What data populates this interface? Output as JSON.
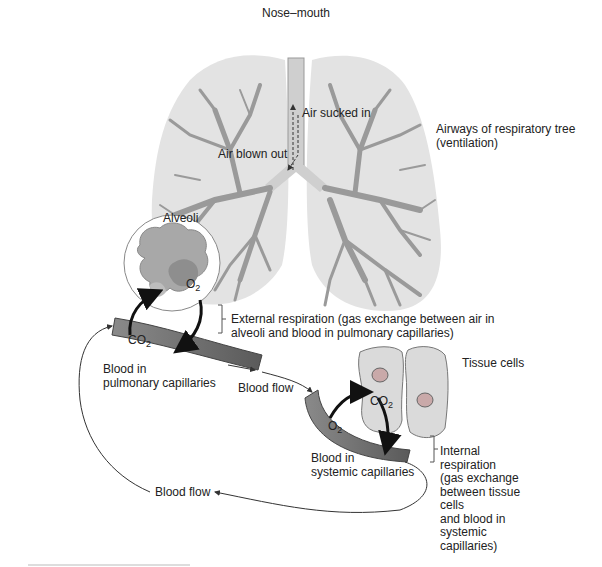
{
  "labels": {
    "nose_mouth": "Nose–mouth",
    "air_sucked_in": "Air sucked in",
    "air_blown_out": "Air blown out",
    "airways_line1": "Airways of respiratory tree",
    "airways_line2": "(ventilation)",
    "alveoli": "Alveoli",
    "o2_alveoli": "O",
    "o2_alveoli_sub": "2",
    "co2_pulmonary": "CO",
    "co2_pulmonary_sub": "2",
    "external_line1": "External respiration (gas exchange between air in",
    "external_line2": "alveoli and blood in pulmonary capillaries)",
    "blood_pulmonary_line1": "Blood in",
    "blood_pulmonary_line2": "pulmonary capillaries",
    "blood_flow_top": "Blood flow",
    "tissue_cells": "Tissue cells",
    "co2_tissue": "CO",
    "co2_tissue_sub": "2",
    "o2_systemic": "O",
    "o2_systemic_sub": "2",
    "blood_systemic_line1": "Blood in",
    "blood_systemic_line2": "systemic capillaries",
    "internal_lines": [
      "Internal",
      "respiration",
      "(gas exchange",
      "between tissue",
      "cells",
      "and blood in",
      "systemic",
      "capillaries)"
    ],
    "blood_flow_bottom": "Blood flow"
  },
  "colors": {
    "lung_fill": "#e3e3e3",
    "airway": "#9a9a9a",
    "trachea": "#cfcfcf",
    "capillary": "#6e6e6e",
    "alveoli": "#a8a8a8",
    "tissue_cell": "#dadada",
    "arrow": "#111111"
  }
}
